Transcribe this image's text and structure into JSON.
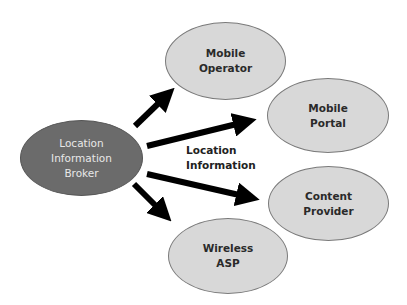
{
  "diagram": {
    "type": "hub-and-spoke",
    "hub": {
      "id": "broker",
      "lines": [
        "Location",
        "Information",
        "Broker"
      ],
      "fill": "#6b6b6b",
      "text_color": "#e8e8e8"
    },
    "targets": [
      {
        "id": "mobile-operator",
        "lines": [
          "Mobile",
          "Operator"
        ],
        "fill": "#d8d8d8"
      },
      {
        "id": "mobile-portal",
        "lines": [
          "Mobile",
          "Portal"
        ],
        "fill": "#d8d8d8"
      },
      {
        "id": "content-provider",
        "lines": [
          "Content",
          "Provider"
        ],
        "fill": "#d8d8d8"
      },
      {
        "id": "wireless-asp",
        "lines": [
          "Wireless",
          "ASP"
        ],
        "fill": "#d8d8d8"
      }
    ],
    "edge_label": {
      "lines": [
        "Location",
        "Information"
      ]
    },
    "edges": [
      {
        "from": "broker",
        "to": "mobile-operator"
      },
      {
        "from": "broker",
        "to": "mobile-portal"
      },
      {
        "from": "broker",
        "to": "content-provider"
      },
      {
        "from": "broker",
        "to": "wireless-asp"
      }
    ]
  }
}
